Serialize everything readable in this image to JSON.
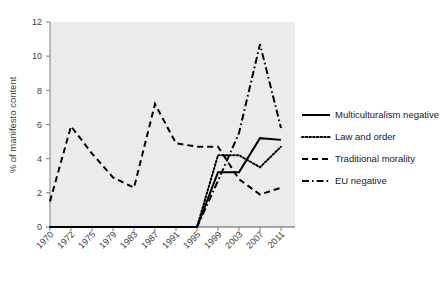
{
  "chart_data": {
    "type": "line",
    "title": "",
    "xlabel": "",
    "ylabel": "% of manifesto content",
    "categories": [
      "1970",
      "1972",
      "1975",
      "1979",
      "1983",
      "1987",
      "1991",
      "1995",
      "1999",
      "2003",
      "2007",
      "2011"
    ],
    "ylim": [
      0,
      12
    ],
    "yticks": [
      "0",
      "2",
      "4",
      "6",
      "8",
      "10",
      "12"
    ],
    "grid": false,
    "legend_position": "right",
    "plot_background": "#ebebeb",
    "series": [
      {
        "name": "Multiculturalism negative",
        "style": "solid",
        "color": "#000000",
        "values": [
          0,
          0,
          0,
          0,
          0,
          0,
          0,
          0,
          3.2,
          3.2,
          5.2,
          5.1
        ]
      },
      {
        "name": "Law and order",
        "style": "dotted",
        "color": "#000000",
        "values": [
          0,
          0,
          0,
          0,
          0,
          0,
          0,
          0,
          4.2,
          4.2,
          3.5,
          4.7
        ]
      },
      {
        "name": "Traditional morality",
        "style": "dashed",
        "color": "#000000",
        "values": [
          1.5,
          5.9,
          4.3,
          2.9,
          2.3,
          7.2,
          4.9,
          4.7,
          4.7,
          2.8,
          1.9,
          2.3
        ]
      },
      {
        "name": "EU negative",
        "style": "dash-dot",
        "color": "#000000",
        "values": [
          0,
          0,
          0,
          0,
          0,
          0,
          0,
          0,
          2.7,
          5.5,
          10.7,
          5.8
        ]
      }
    ]
  },
  "legend": {
    "items": [
      {
        "label": "Multiculturalism negative",
        "style": "solid"
      },
      {
        "label": "Law and order",
        "style": "dotted"
      },
      {
        "label": "Traditional morality",
        "style": "dashed"
      },
      {
        "label": "EU negative",
        "style": "dash-dot"
      }
    ]
  }
}
